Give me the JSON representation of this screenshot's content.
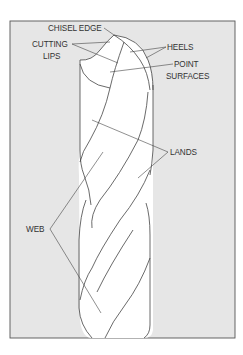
{
  "figure": {
    "colors": {
      "frame_fill": "#e6e6e6",
      "frame_border": "#555555",
      "drill_fill": "#ffffff",
      "line": "#444444",
      "text": "#333333"
    },
    "labels": {
      "chisel_edge": "CHISEL EDGE",
      "cutting_lips_1": "CUTTING",
      "cutting_lips_2": "LIPS",
      "heels": "HEELS",
      "point_surfaces_1": "POINT",
      "point_surfaces_2": "SURFACES",
      "lands": "LANDS",
      "web": "WEB"
    }
  }
}
